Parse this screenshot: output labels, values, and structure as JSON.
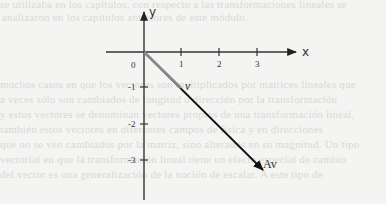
{
  "background_bleed_text": [
    "se utilizaba en los capítulos, con respecto a las transformaciones lineales se",
    "analizaron en los capítulos anteriores de este módulo.",
    "muchos casos en que los vectores son multiplicados por matrices lineales que",
    "a veces sólo son cambiados de longitud o dirección por la transformación",
    "y estos vectores se denominan vectores propios de una transformación lineal,",
    "también estos vectores en diferentes campos de física y en direcciones",
    "que no se ven cambiados por la matriz, sino alterados en su magnitud. Un tipo",
    "vectorial en que la transformación lineal tiene un efecto especial de cambio",
    "del vector es una generalización de la noción de escalar. A este tipo de"
  ],
  "diagram": {
    "axes": {
      "x_label": "x",
      "y_label": "y",
      "origin_label": "0",
      "x_ticks": [
        "1",
        "2",
        "3"
      ],
      "y_ticks": [
        "-1",
        "-2",
        "-3"
      ]
    },
    "vectors": [
      {
        "label": "v",
        "from": [
          0,
          0
        ],
        "to": [
          1,
          -1
        ],
        "color": "#8a8a8a"
      },
      {
        "label": "Av",
        "from": [
          0,
          0
        ],
        "to": [
          3,
          -3
        ],
        "color": "#1a1a1a"
      }
    ]
  }
}
